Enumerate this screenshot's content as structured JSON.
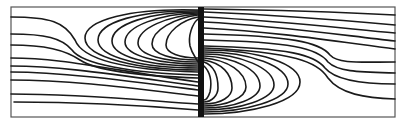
{
  "figure": {
    "type": "streamline-diagram",
    "colors": {
      "line": "#1a1a1a",
      "frame": "#555555",
      "barrier": "#111111",
      "background": "#ffffff"
    },
    "frame": {
      "x": 11,
      "y": 7,
      "width": 384,
      "height": 110
    },
    "barrier": {
      "x": 198,
      "y": 7,
      "width": 6,
      "height": 110
    }
  }
}
